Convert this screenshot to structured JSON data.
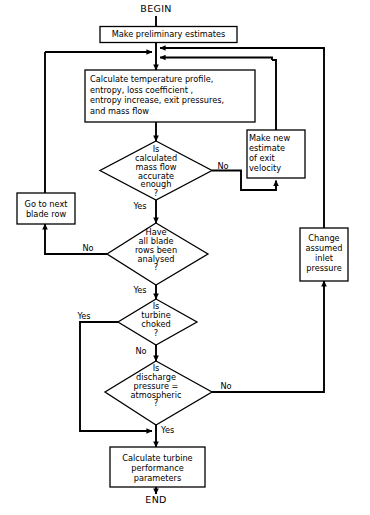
{
  "diagram": {
    "line_color": "#000000",
    "fill_color": "#ffffff"
  },
  "terminals": [
    {
      "id": "begin",
      "label": "BEGIN"
    },
    {
      "id": "end",
      "label": "END"
    }
  ],
  "processes": [
    {
      "id": "preliminary",
      "label": "Make preliminary estimates"
    },
    {
      "id": "calculate",
      "label": "Calculate temperature profile,\nentropy, loss coefficient ,\nentropy increase, exit pressures,\nand  mass flow"
    },
    {
      "id": "new_estimate",
      "label": "Make new\nestimate\nof exit\nvelocity"
    },
    {
      "id": "next_blade",
      "label": "Go to next\nblade row"
    },
    {
      "id": "change_inlet",
      "label": "Change\nassumed\ninlet\npressure"
    },
    {
      "id": "performance",
      "label": "Calculate turbine\nperformance\nparameters"
    }
  ],
  "decisions": [
    {
      "id": "mass_flow",
      "label": "Is\ncalculated\nmass flow\naccurate\nenough\n?"
    },
    {
      "id": "blade_rows",
      "label": "Have\nall blade\nrows been\nanalysed\n?"
    },
    {
      "id": "choked",
      "label": "Is\nturbine\nchoked\n?"
    },
    {
      "id": "discharge",
      "label": "Is\ndischarge\npressure =\natmospheric\n?"
    }
  ],
  "edge_labels": [
    {
      "id": "mass_flow_no",
      "label": "No"
    },
    {
      "id": "mass_flow_yes",
      "label": "Yes"
    },
    {
      "id": "blade_rows_no",
      "label": "No"
    },
    {
      "id": "blade_rows_yes",
      "label": "Yes"
    },
    {
      "id": "choked_yes",
      "label": "Yes"
    },
    {
      "id": "choked_no",
      "label": "No"
    },
    {
      "id": "discharge_no",
      "label": "No"
    },
    {
      "id": "discharge_yes",
      "label": "Yes"
    }
  ]
}
